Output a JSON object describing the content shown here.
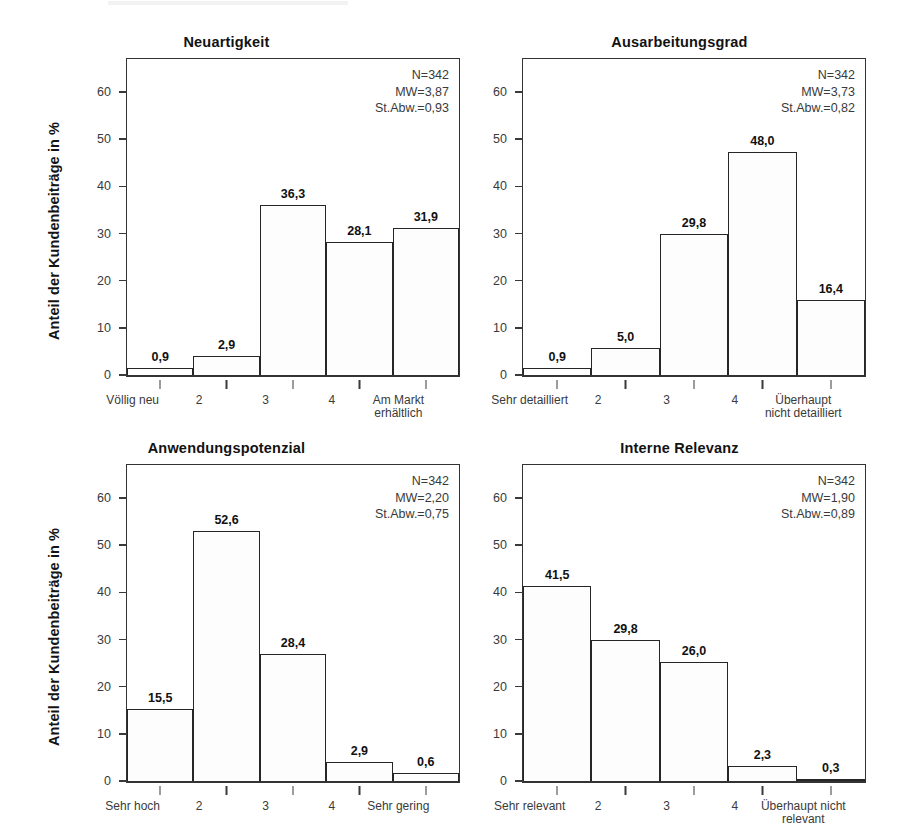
{
  "figure": {
    "y_axis_title": "Anteil der Kundenbeiträge in %",
    "y_ticks": [
      "0",
      "10",
      "20",
      "30",
      "40",
      "50",
      "60"
    ],
    "stat_labels": {
      "n": "N=",
      "mean": "MW=",
      "sd": "St.Abw.="
    }
  },
  "chart_data": [
    {
      "type": "bar",
      "panel": 0,
      "title": "Neuartigkeit",
      "ylabel": "Anteil der Kundenbeiträge in %",
      "xlabel": "",
      "categories": [
        "Völlig neu",
        "2",
        "3",
        "4",
        "Am Markt\nerhältlich"
      ],
      "values": [
        0.9,
        2.9,
        36.3,
        28.1,
        31.9
      ],
      "drawn_heights": [
        1.5,
        4.1,
        36.0,
        28.2,
        31.1
      ],
      "data_labels": [
        "0,9",
        "2,9",
        "36,3",
        "28,1",
        "31,9"
      ],
      "ylim": [
        0,
        67
      ],
      "yticks": [
        0,
        10,
        20,
        30,
        40,
        50,
        60
      ],
      "ytick_labels": [
        "0",
        "10",
        "20",
        "30",
        "40",
        "50",
        "60"
      ],
      "grid": false,
      "legend": "none",
      "annotations": {
        "N": "N=342",
        "MW": "MW=3,87",
        "StAbw": "St.Abw.=0,93"
      }
    },
    {
      "type": "bar",
      "panel": 1,
      "title": "Ausarbeitungsgrad",
      "ylabel": "",
      "xlabel": "",
      "categories": [
        "Sehr detailliert",
        "2",
        "3",
        "4",
        "Überhaupt\nnicht detailliert"
      ],
      "values": [
        0.9,
        5.0,
        29.8,
        48.0,
        16.4
      ],
      "drawn_heights": [
        1.5,
        5.8,
        30.0,
        47.3,
        16.0
      ],
      "data_labels": [
        "0,9",
        "5,0",
        "29,8",
        "48,0",
        "16,4"
      ],
      "ylim": [
        0,
        67
      ],
      "yticks": [
        0,
        10,
        20,
        30,
        40,
        50,
        60
      ],
      "ytick_labels": [
        "0",
        "10",
        "20",
        "30",
        "40",
        "50",
        "60"
      ],
      "grid": false,
      "legend": "none",
      "annotations": {
        "N": "N=342",
        "MW": "MW=3,73",
        "StAbw": "St.Abw.=0,82"
      }
    },
    {
      "type": "bar",
      "panel": 2,
      "title": "Anwendungspotenzial",
      "ylabel": "Anteil der Kundenbeiträge in %",
      "xlabel": "",
      "categories": [
        "Sehr hoch",
        "2",
        "3",
        "4",
        "Sehr gering"
      ],
      "values": [
        15.5,
        52.6,
        28.4,
        2.9,
        0.6
      ],
      "drawn_heights": [
        15.3,
        53.0,
        27.0,
        4.0,
        1.7
      ],
      "data_labels": [
        "15,5",
        "52,6",
        "28,4",
        "2,9",
        "0,6"
      ],
      "ylim": [
        0,
        67
      ],
      "yticks": [
        0,
        10,
        20,
        30,
        40,
        50,
        60
      ],
      "ytick_labels": [
        "0",
        "10",
        "20",
        "30",
        "40",
        "50",
        "60"
      ],
      "grid": false,
      "legend": "none",
      "annotations": {
        "N": "N=342",
        "MW": "MW=2,20",
        "StAbw": "St.Abw.=0,75"
      }
    },
    {
      "type": "bar",
      "panel": 3,
      "title": "Interne Relevanz",
      "ylabel": "",
      "xlabel": "",
      "categories": [
        "Sehr relevant",
        "2",
        "3",
        "4",
        "Überhaupt nicht\nrelevant"
      ],
      "values": [
        41.5,
        29.8,
        26.0,
        2.3,
        0.3
      ],
      "drawn_heights": [
        41.3,
        30.0,
        25.2,
        3.2,
        0.4
      ],
      "data_labels": [
        "41,5",
        "29,8",
        "26,0",
        "2,3",
        "0,3"
      ],
      "ylim": [
        0,
        67
      ],
      "yticks": [
        0,
        10,
        20,
        30,
        40,
        50,
        60
      ],
      "ytick_labels": [
        "0",
        "10",
        "20",
        "30",
        "40",
        "50",
        "60"
      ],
      "grid": false,
      "legend": "none",
      "annotations": {
        "N": "N=342",
        "MW": "MW=1,90",
        "StAbw": "St.Abw.=0,89"
      }
    }
  ]
}
